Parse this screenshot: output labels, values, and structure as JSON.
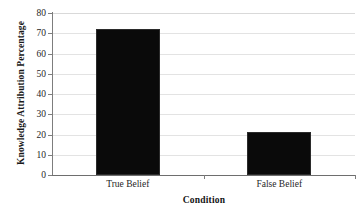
{
  "chart_data": {
    "type": "bar",
    "title": "",
    "categories": [
      "True Belief",
      "False Belief"
    ],
    "values": [
      72,
      21
    ],
    "xlabel": "Condition",
    "ylabel": "Knowledge Attribution Percentage",
    "ylim": [
      0,
      80
    ],
    "yticks": [
      0,
      10,
      20,
      30,
      40,
      50,
      60,
      70,
      80
    ],
    "ytick_labels": [
      "0",
      "10",
      "20",
      "30",
      "40",
      "50",
      "60",
      "70",
      "80"
    ],
    "grid": true,
    "grid_axis": "y",
    "legend": false,
    "legend_position": "none",
    "bar_color": "#0a0a0a",
    "gridline_color": "#e3e3e3",
    "axis_color": "#7d7d7d",
    "background_color": "#ffffff"
  }
}
